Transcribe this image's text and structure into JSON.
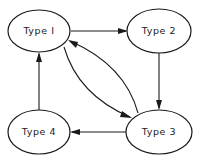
{
  "diagram": {
    "type": "state-transition",
    "nodes": [
      {
        "id": "t1",
        "label": "Type I"
      },
      {
        "id": "t2",
        "label": "Type 2"
      },
      {
        "id": "t3",
        "label": "Type 3"
      },
      {
        "id": "t4",
        "label": "Type 4"
      }
    ],
    "edges": [
      {
        "from": "t1",
        "to": "t2"
      },
      {
        "from": "t2",
        "to": "t3"
      },
      {
        "from": "t3",
        "to": "t4"
      },
      {
        "from": "t4",
        "to": "t1"
      },
      {
        "from": "t1",
        "to": "t3"
      },
      {
        "from": "t3",
        "to": "t1"
      }
    ],
    "colors": {
      "stroke": "#1a1a1a",
      "background": "#ffffff"
    }
  }
}
